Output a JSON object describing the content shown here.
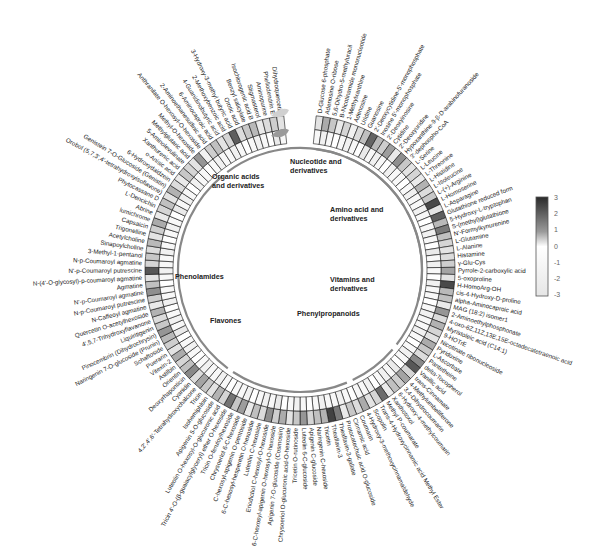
{
  "chart_data": {
    "type": "heatmap",
    "layout": "circular",
    "title": "",
    "rings": 2,
    "color_scale": {
      "min": -3,
      "max": 3,
      "ticks": [
        3,
        2,
        1,
        0,
        -1,
        -2,
        -3
      ],
      "low": "#f4f4f4",
      "mid": "#ffffff",
      "high": "#2a2a2a"
    },
    "categories": [
      {
        "name": "Nucleotide and derivatives",
        "line1": "Nucleotide and",
        "line2": "derivatives",
        "start": 0,
        "end": 20
      },
      {
        "name": "Amino acid and derivatives",
        "line1": "Amino acid and",
        "line2": "derivatives",
        "start": 20,
        "end": 46
      },
      {
        "name": "Vitamins and derivatives",
        "line1": "Vitamins and",
        "line2": "derivatives",
        "start": 46,
        "end": 56
      },
      {
        "name": "Phenylpropanoids",
        "line1": "Phenylpropanoids",
        "line2": "",
        "start": 56,
        "end": 78
      },
      {
        "name": "Flavones",
        "line1": "Flavones",
        "line2": "",
        "start": 78,
        "end": 118
      },
      {
        "name": "Phenolamides",
        "line1": "Phenolamides",
        "line2": "",
        "start": 118,
        "end": 140
      },
      {
        "name": "Organic acids and derivatives",
        "line1": "Organic acids",
        "line2": "and derivatives",
        "start": 140,
        "end": 172
      }
    ],
    "metabolites": [
      "D-Glucose 6-phosphate",
      "Adenosine O-ribose",
      "5,6-Dihydro-5-methyluracil",
      "B-Nicotinamide mononucleotide",
      "1-Methylxanthine",
      "Adenosine",
      "Uridine",
      "Guanosine",
      "2'-Deoxycytidine-5'-monophosphate",
      "Inosine 5'-monophosphate",
      "2'-Deoxyinosine",
      "Cytidine",
      "2'-Deoxyuridine",
      "Hypoxanthine-9-β-D-arabinofuranoside",
      "3'-dephospho-CoA",
      "L-Serine",
      "L-Leucine",
      "L-Threonine",
      "L-Histidine",
      "L-Isoleucine",
      "L-(+)-Arginine",
      "L-Homoserine",
      "L-Asparagine",
      "Glutathione reduced form",
      "5-Hydroxy-L-tryptophan",
      "S-(methyl)glutathione",
      "N'-Formylkynurenine",
      "L-Glutamine",
      "L-Alanine",
      "Histamine",
      "γ-Glu-Cys",
      "Pyrrole-2-carboxylic acid",
      "5-oxoproline",
      "H-HomoArg-OH",
      "cis-4-Hydroxy-D-proline",
      "alpha-Aminocaproic acid",
      "MAG (18:2) isomer1",
      "2-Aminoethylphosphonate",
      "4-oxo-6Z,11Z,13E,15E-octadecatetraenoic acid",
      "Myristoleic acid (C14:1)",
      "9-HOTrE",
      "Nicotinate ribonucleoside",
      "Pyridoxine",
      "L-Ascorbate",
      "Pantetheine",
      "delta-Tocopherol",
      "Vanillic acid",
      "trans-Cinnamate",
      "4-Methylumbelliferone",
      "3,4-Dihydrocoumarin",
      "6-Hydroxy-4-methylcoumarin",
      "Xanthotoxol",
      "Methyl P-coumarate",
      "Trans-4-Hydroxycinnamic acid Methyl Ester",
      "Scopolin",
      "4-Hydroxy-3-methoxycinnamaldehyde",
      "Coumarin",
      "Cinnamic acid",
      "Protocatechuic acid O-glucoside",
      "Theaflavin-3-gallate",
      "Theaflavin-3",
      "Tricetin",
      "Naringenin C-hexoside",
      "Apigenin C-glucoside",
      "Luteolin 6-C-glucoside",
      "Tricetin O-rutinoside",
      "Chrysoeriol O-glucuronic acid-O-hexoside",
      "Apigenin 7-O-glucoside (Cosmosiin)",
      "6-C-hexosyl-apigenin O-hexosyl-O-hexoside",
      "Eriodictiol C-hexosyl-O-hexoside",
      "Luteolin C-hexoside",
      "6-C-hexosyl-hesperetin O-hexoside",
      "C-hexosyl-apigenin O-pentoside",
      "Chrysoeriol 6-C-hexoside",
      "Tricin O-feruloylhexoside",
      "Tricin 4'-O-(β-guaiacylglyceryl) ether O-hexoside",
      "Luteolin O-hexosyl-O-glucuronic acid",
      "Apigenin 5-O-glucoside",
      "Isohemiphloin",
      "Tricin",
      "4,2',4',6'-Tetrahydroxychalcone",
      "Cyanidin",
      "Deoxyrhaponticin",
      "Orientin",
      "Astilbin",
      "Vitexin-2",
      "Puerarin",
      "Schaftoside",
      "Naringenin 7-O-glucoside (Prunin)",
      "Pinocembrin (Dihydrochrysin)",
      "Liquiritigenin",
      "4',5,7-Trihydroxyflavanone",
      "Quercetin O-acetylhexoside",
      "N-Caffeoyl agmatine",
      "N-p-Coumaroyl putrescine",
      "N'-p-Coumaroyl agmatine",
      "Agmatine",
      "N-(4'-O-glycosyl)-p-coumaroyl agmatine",
      "N'-p-Coumaroyl putrescine",
      "N-p-Coumaroyl agmatine",
      "3-Methyl-1-pentanol",
      "Sinapoylcholine",
      "Acetylcholine",
      "Trigonelline",
      "Capsaicin",
      "lumichrome",
      "Abrine",
      "L-Dencichin",
      "Phytocassane D",
      "Orobol (5,7,3',4'-tetrahydroxyisoflavone)",
      "Genistein 7-O-Glucoside (Genistin)",
      "6-Hydroxydaidzein",
      "o-Anisic acid",
      "Xanthurenic acid",
      "5-Aminolevulinate",
      "Methylglutaric acid",
      "Methyl-O-hexoside",
      "Anthranilate O-hexosyl-O-hexoside",
      "2-Aminoethanesulfinic acid",
      "6-Aminocaproic acid",
      "4-Guanidinobutyric acid",
      "2-Methoxybenzoic acid",
      "3-Hydroxy-3-methyl butyric acid",
      "Orotic acid",
      "Benzyl salicylate",
      "Isochlorogenic acid B",
      "Stigmasterol",
      "Aminopurine",
      "Phellodendrin E",
      "Dihydroquercetin"
    ],
    "outer_ring_values": [
      0.4,
      1.2,
      0.8,
      0.3,
      0.6,
      0.2,
      0.5,
      0.9,
      2.2,
      1.0,
      0.7,
      1.4,
      0.3,
      1.6,
      0.8,
      0.4,
      0.6,
      0.3,
      1.1,
      0.5,
      0.8,
      2.6,
      0.4,
      2.3,
      1.0,
      1.9,
      0.9,
      0.6,
      0.4,
      0.5,
      0.7,
      1.3,
      0.4,
      2.6,
      1.0,
      0.9,
      0.3,
      1.5,
      0.5,
      1.1,
      0.6,
      0.4,
      1.2,
      0.8,
      0.5,
      1.7,
      2.4,
      0.6,
      1.3,
      0.7,
      0.9,
      0.3,
      2.1,
      0.6,
      0.4,
      1.2,
      0.5,
      0.8,
      0.3,
      1.9,
      2.7,
      1.1,
      0.9,
      0.6,
      1.5,
      0.8,
      0.4,
      1.2,
      0.7,
      1.6,
      0.5,
      0.9,
      0.3,
      1.4,
      0.8,
      2.0,
      0.6,
      1.1,
      0.4,
      0.8,
      1.3,
      0.5,
      1.7,
      0.9,
      0.6,
      1.2,
      0.4,
      0.7,
      1.0,
      1.5,
      0.8,
      0.5,
      1.1,
      0.3,
      0.7,
      1.6,
      0.9,
      0.4,
      2.4,
      0.6,
      0.8,
      0.5,
      1.0,
      0.4,
      0.7,
      1.2,
      0.3,
      0.6,
      0.9,
      0.4,
      1.1,
      0.5,
      0.3,
      0.8,
      0.6,
      0.4,
      1.5,
      0.2,
      0.7,
      0.9,
      0.4,
      0.6,
      2.3,
      0.5,
      0.8,
      1.0,
      0.3,
      0.5,
      0.7,
      0.4,
      0.6,
      1.4,
      0.5,
      0.3,
      0.8,
      0.4,
      0.6,
      0.3,
      0.9,
      0.5,
      0.4,
      1.2,
      0.6,
      0.3,
      0.5,
      0.8,
      0.4,
      0.6,
      1.3,
      0.5,
      0.7,
      0.4,
      1.8,
      0.6,
      0.5,
      1.1,
      0.3,
      0.8,
      0.6,
      1.4,
      0.4,
      0.7,
      1.5,
      0.5,
      0.9,
      0.4,
      1.7,
      0.6
    ],
    "inner_ring_values": [
      0.1,
      0.2,
      0.1,
      0.0,
      0.1,
      0.2,
      0.1,
      0.0,
      0.3,
      0.1,
      0.2,
      0.1,
      0.0,
      0.2,
      0.1,
      0.1,
      0.0,
      0.1,
      0.2,
      0.1
    ]
  },
  "legend": {
    "ticks": [
      "3",
      "2",
      "1",
      "0",
      "-1",
      "-2",
      "-3"
    ]
  },
  "decorations": {
    "leaf_icons": 2
  }
}
